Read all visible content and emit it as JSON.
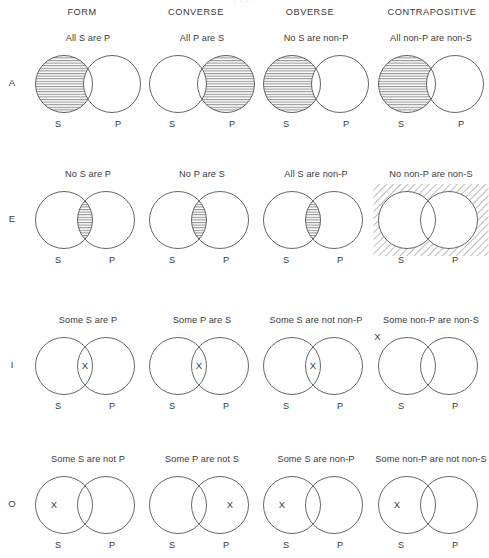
{
  "top_strip": {
    "clipped_text": "·   ·   ·   ·"
  },
  "columns": [
    {
      "key": "form",
      "label": "FORM",
      "center_x": 82
    },
    {
      "key": "converse",
      "label": "CONVERSE",
      "center_x": 196
    },
    {
      "key": "obverse",
      "label": "OBVERSE",
      "center_x": 310
    },
    {
      "key": "contrapositive",
      "label": "CONTRAPOSITIVE",
      "center_x": 432
    }
  ],
  "rows": [
    {
      "key": "A",
      "letter": "A",
      "letter_y": 77,
      "cell_y": 33
    },
    {
      "key": "E",
      "letter": "E",
      "letter_y": 213,
      "cell_y": 169
    },
    {
      "key": "I",
      "letter": "I",
      "letter_y": 359,
      "cell_y": 315
    },
    {
      "key": "O",
      "letter": "O",
      "letter_y": 498,
      "cell_y": 454
    }
  ],
  "circle_labels": {
    "s": "S",
    "p": "P"
  },
  "x_marker": "X",
  "colors": {
    "stroke": "#555555",
    "hatch": "#6b6b6b",
    "text": "#3a3a3a",
    "background": "#ffffff",
    "clipped_text": "#c9c9c9"
  },
  "chart_data": {
    "type": "diagram-grid",
    "row_axis": "Categorical proposition type (A, E, I, O)",
    "column_axis": "Inference operation",
    "categories": [
      "FORM",
      "CONVERSE",
      "OBVERSE",
      "CONTRAPOSITIVE"
    ],
    "row_categories": [
      "A",
      "E",
      "I",
      "O"
    ],
    "cells": [
      {
        "row": "A",
        "column": "FORM",
        "caption": "All S are P",
        "overlap": "small",
        "shading": "left-only",
        "marker": "none"
      },
      {
        "row": "A",
        "column": "CONVERSE",
        "caption": "All P are S",
        "overlap": "small",
        "shading": "right-only",
        "marker": "none"
      },
      {
        "row": "A",
        "column": "OBVERSE",
        "caption": "No S are non-P",
        "overlap": "small",
        "shading": "left-only",
        "marker": "none"
      },
      {
        "row": "A",
        "column": "CONTRAPOSITIVE",
        "caption": "All non-P are non-S",
        "overlap": "small",
        "shading": "left-only",
        "marker": "none"
      },
      {
        "row": "E",
        "column": "FORM",
        "caption": "No S are P",
        "overlap": "large",
        "shading": "lens",
        "marker": "none"
      },
      {
        "row": "E",
        "column": "CONVERSE",
        "caption": "No P are S",
        "overlap": "large",
        "shading": "lens",
        "marker": "none"
      },
      {
        "row": "E",
        "column": "OBVERSE",
        "caption": "All S are non-P",
        "overlap": "large",
        "shading": "lens",
        "marker": "none"
      },
      {
        "row": "E",
        "column": "CONTRAPOSITIVE",
        "caption": "No non-P are non-S",
        "overlap": "large",
        "shading": "outside-diagonal",
        "marker": "none"
      },
      {
        "row": "I",
        "column": "FORM",
        "caption": "Some S are P",
        "overlap": "large",
        "shading": "none",
        "marker": "lens"
      },
      {
        "row": "I",
        "column": "CONVERSE",
        "caption": "Some P are S",
        "overlap": "large",
        "shading": "none",
        "marker": "lens"
      },
      {
        "row": "I",
        "column": "OBVERSE",
        "caption": "Some S are not non-P",
        "overlap": "large",
        "shading": "none",
        "marker": "lens"
      },
      {
        "row": "I",
        "column": "CONTRAPOSITIVE",
        "caption": "Some non-P are non-S",
        "overlap": "large",
        "shading": "none",
        "marker": "outside-top-left"
      },
      {
        "row": "O",
        "column": "FORM",
        "caption": "Some S are not P",
        "overlap": "large",
        "shading": "none",
        "marker": "left-only"
      },
      {
        "row": "O",
        "column": "CONVERSE",
        "caption": "Some P are not S",
        "overlap": "large",
        "shading": "none",
        "marker": "right-only"
      },
      {
        "row": "O",
        "column": "OBVERSE",
        "caption": "Some S are non-P",
        "overlap": "large",
        "shading": "none",
        "marker": "left-only"
      },
      {
        "row": "O",
        "column": "CONTRAPOSITIVE",
        "caption": "Some non-P are not non-S",
        "overlap": "large",
        "shading": "none",
        "marker": "left-only"
      }
    ]
  }
}
